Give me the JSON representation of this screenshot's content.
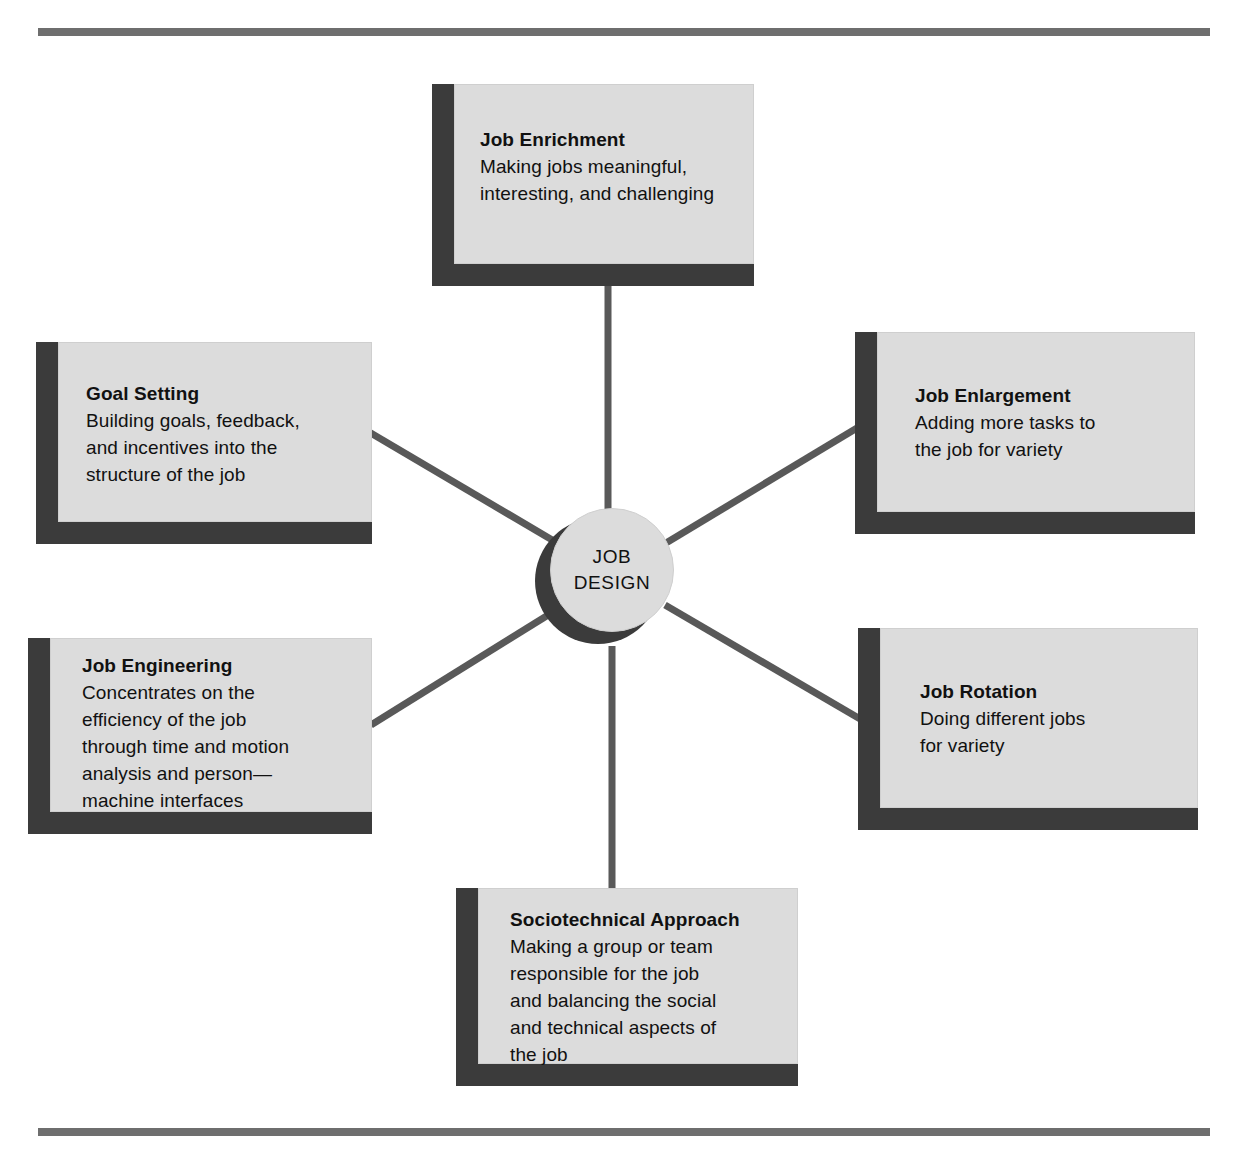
{
  "diagram": {
    "title": "Job Design",
    "hub": {
      "line1": "JOB",
      "line2": "DESIGN"
    },
    "colors": {
      "page_background": "#ffffff",
      "box_fill": "#dcdcdc",
      "box_shadow": "#3b3b3b",
      "rule": "#6e6e6e",
      "connector": "#595959",
      "text": "#111111"
    },
    "rules": {
      "top_label": "top-rule",
      "bottom_label": "bottom-rule"
    },
    "nodes": [
      {
        "id": "job-enrichment",
        "title": "Job Enrichment",
        "description": "Making jobs meaningful,\ninteresting, and challenging"
      },
      {
        "id": "goal-setting",
        "title": "Goal Setting",
        "description": "Building goals, feedback,\nand incentives into the\nstructure of the job"
      },
      {
        "id": "job-enlargement",
        "title": "Job Enlargement",
        "description": "Adding more tasks to\nthe job for variety"
      },
      {
        "id": "job-engineering",
        "title": "Job Engineering",
        "description": "Concentrates on the\nefficiency of the job\nthrough time and motion\nanalysis and person—\nmachine interfaces"
      },
      {
        "id": "job-rotation",
        "title": "Job Rotation",
        "description": "Doing different jobs\nfor variety"
      },
      {
        "id": "sociotechnical-approach",
        "title": "Sociotechnical Approach",
        "description": "Making a group or team\nresponsible for the job\nand balancing the social\nand technical aspects of\nthe job"
      }
    ],
    "connectors": [
      {
        "id": "hub-to-job-enrichment",
        "from": "hub",
        "to": "job-enrichment"
      },
      {
        "id": "hub-to-goal-setting",
        "from": "hub",
        "to": "goal-setting"
      },
      {
        "id": "hub-to-job-enlargement",
        "from": "hub",
        "to": "job-enlargement"
      },
      {
        "id": "hub-to-job-engineering",
        "from": "hub",
        "to": "job-engineering"
      },
      {
        "id": "hub-to-job-rotation",
        "from": "hub",
        "to": "job-rotation"
      },
      {
        "id": "hub-to-sociotechnical",
        "from": "hub",
        "to": "sociotechnical-approach"
      }
    ]
  }
}
